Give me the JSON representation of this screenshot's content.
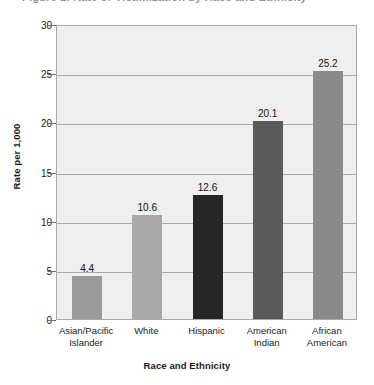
{
  "title_remnant": "Figure 1. Rate of Victimization by Race and Ethnicity",
  "chart_data": {
    "type": "bar",
    "title": "",
    "xlabel": "Race and Ethnicity",
    "ylabel": "Rate per 1,000",
    "ylim": [
      0,
      30
    ],
    "ytick_step": 5,
    "ytick_labels": [
      "0",
      "5",
      "10",
      "15",
      "20",
      "25",
      "30"
    ],
    "ytick_values": [
      0,
      5,
      10,
      15,
      20,
      25,
      30
    ],
    "grid": true,
    "legend": "none",
    "categories": [
      "Asian/Pacific Islander",
      "White",
      "Hispanic",
      "American Indian",
      "African American"
    ],
    "category_lines": [
      [
        "Asian/Pacific",
        "Islander"
      ],
      [
        "White"
      ],
      [
        "Hispanic"
      ],
      [
        "American",
        "Indian"
      ],
      [
        "African",
        "American"
      ]
    ],
    "values": [
      4.4,
      10.6,
      12.6,
      20.1,
      25.2
    ],
    "value_labels": [
      "4.4",
      "10.6",
      "12.6",
      "20.1",
      "25.2"
    ],
    "bar_colors": [
      "#9a9a9a",
      "#a8a8a8",
      "#262626",
      "#5a5a5a",
      "#8a8a8a"
    ]
  },
  "colors": {
    "plot_background": "#efefef",
    "plot_border": "#a9a9a9",
    "gridline": "#a9a9a9",
    "text": "#1a1a1a",
    "page_background": "#ffffff"
  }
}
